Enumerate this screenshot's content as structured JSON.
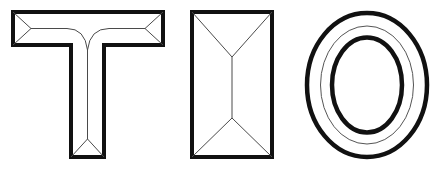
{
  "canvas": {
    "width": 437,
    "height": 170,
    "background_color": "#ffffff",
    "description": "Three outlined block letterform templates drawn side by side on a white field"
  },
  "style": {
    "outline_color": "#111111",
    "outline_width": 4,
    "mitre_line_color": "#4a4a4a",
    "mitre_line_width": 1,
    "fill_color": "#ffffff"
  },
  "glyphs": [
    {
      "id": "glyph-t",
      "character": "T",
      "name": "letter-t-outline",
      "order": 1,
      "bounds": {
        "x": 13,
        "y": 12,
        "width": 150,
        "height": 145
      },
      "construction": "serif-less block T with mitred crossbar-to-stem joints",
      "metrics": {
        "crossbar_left": 13,
        "crossbar_right": 163,
        "crossbar_top": 12,
        "crossbar_bottom": 45,
        "stem_left": 71,
        "stem_right": 104,
        "stem_bottom": 157,
        "crossbar_thickness": 33,
        "stem_width": 33
      },
      "mitre_segments": 4
    },
    {
      "id": "glyph-i",
      "character": "I",
      "name": "letter-i-block-outline",
      "order": 2,
      "bounds": {
        "x": 192,
        "y": 12,
        "width": 80,
        "height": 145
      },
      "construction": "filled-width block I drawn as a rectangle with corner-to-centre mitre diagonals",
      "metrics": {
        "left": 192,
        "right": 272,
        "top": 12,
        "bottom": 157,
        "centre_x": 232,
        "upper_vertex_y": 57,
        "lower_vertex_y": 118
      },
      "mitre_segments": 5
    },
    {
      "id": "glyph-o",
      "character": "O",
      "name": "letter-o-concentric-ellipses",
      "order": 3,
      "bounds": {
        "x": 305,
        "y": 11,
        "width": 124,
        "height": 148
      },
      "construction": "three concentric ellipses: thick outer contour, thin guide ellipse, thick inner counter",
      "metrics": {
        "centre_x": 367,
        "centre_y": 85,
        "outer_rx": 60,
        "outer_ry": 72,
        "guide_rx": 46.5,
        "guide_ry": 59,
        "inner_rx": 35,
        "inner_ry": 47.5
      },
      "ring_count": 3
    }
  ],
  "accessibility": {
    "alt_text": "Outline letter templates spelling T I O",
    "spelled_text": "TIO"
  }
}
